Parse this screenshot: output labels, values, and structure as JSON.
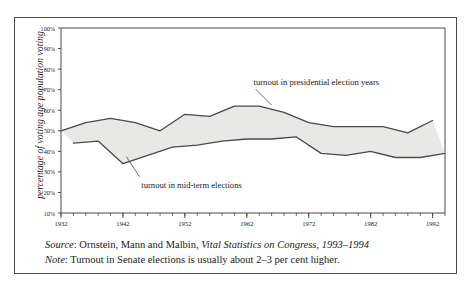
{
  "chart_data": {
    "type": "area",
    "title": "",
    "xlabel": "",
    "ylabel": "percentage of voting age population voting",
    "xlim": [
      1932,
      1994
    ],
    "ylim": [
      0,
      100
    ],
    "ytick_values": [
      10,
      20,
      30,
      40,
      50,
      60,
      70,
      80,
      90,
      100
    ],
    "ytick_labels": [
      "10%",
      "20%",
      "30%",
      "40%",
      "50%",
      "60%",
      "70%",
      "80%",
      "90%",
      "100%"
    ],
    "xtick_labels": [
      "1932",
      "1942",
      "1952",
      "1962",
      "1972",
      "1982",
      "1992"
    ],
    "xtick_values": [
      1932,
      1942,
      1952,
      1962,
      1972,
      1982,
      1992
    ],
    "xtick_minor_step": 2,
    "grid": false,
    "legend_position": "inline-annotations",
    "fill_color": "#e8e8e6",
    "line_color": "#4a4a4a",
    "series": [
      {
        "name": "turnout in presidential election years",
        "x": [
          1932,
          1936,
          1940,
          1944,
          1948,
          1952,
          1956,
          1960,
          1964,
          1968,
          1972,
          1976,
          1980,
          1984,
          1988,
          1992
        ],
        "values": [
          50,
          54,
          56,
          54,
          50,
          58,
          57,
          62,
          62,
          59,
          54,
          52,
          52,
          52,
          49,
          55
        ]
      },
      {
        "name": "turnout in mid-term elections",
        "x": [
          1934,
          1938,
          1942,
          1946,
          1950,
          1954,
          1958,
          1962,
          1966,
          1970,
          1974,
          1978,
          1982,
          1986,
          1990,
          1994
        ],
        "values": [
          44,
          45,
          34,
          38,
          42,
          43,
          45,
          46,
          46,
          47,
          39,
          38,
          40,
          37,
          37,
          39
        ]
      }
    ],
    "annotations": [
      {
        "name": "presidential-annotation",
        "text": "turnout in presidential election years",
        "anchor_x": 1966,
        "anchor_y": 62
      },
      {
        "name": "midterm-annotation",
        "text": "turnout in mid-term elections",
        "anchor_x": 1944,
        "anchor_y": 36
      }
    ]
  },
  "footer": {
    "source_label": "Source",
    "source_text": ": Ornstein, Mann and Malbin, ",
    "source_italic": "Vital Statistics on Congress, 1993–1994",
    "note_label": "Note",
    "note_text": ": Turnout in Senate elections is usually about 2–3 per cent higher."
  }
}
